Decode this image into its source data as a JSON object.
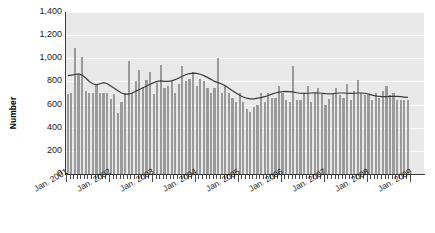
{
  "chart_data": {
    "type": "bar",
    "title": "",
    "subtitle": "",
    "xlabel": "",
    "ylabel": "Number",
    "ylim": [
      0,
      1400
    ],
    "ytick_labels": [
      "1,400",
      "1,200",
      "1,000",
      "800",
      "600",
      "400",
      "200",
      "0"
    ],
    "ytick_values": [
      1400,
      1200,
      1000,
      800,
      600,
      400,
      200,
      0
    ],
    "grid": true,
    "legend": "none",
    "x_tick_interval": "monthly",
    "x_major_tick_interval": "yearly",
    "xtick_labels": [
      "Jan. 2001",
      "Jan. 2002",
      "Jan. 2003",
      "Jan. 2004",
      "Jan. 2005",
      "Jan. 2006",
      "Jan. 2007",
      "Jan. 2008",
      "Jan. 2009"
    ],
    "colors": {
      "bar": "#9a9a9a",
      "trend_line": "#3a3a3a",
      "plot_background": "#e9e9e9",
      "gridline": "#fbfbfb",
      "axis": "#3a3a3a",
      "text": "#1a1a1a"
    },
    "series": [
      {
        "name": "Number",
        "type": "bar",
        "values": [
          690,
          700,
          1090,
          860,
          1010,
          720,
          700,
          700,
          780,
          700,
          700,
          700,
          650,
          690,
          530,
          620,
          700,
          980,
          700,
          800,
          900,
          750,
          810,
          880,
          690,
          790,
          940,
          740,
          760,
          800,
          700,
          780,
          930,
          800,
          820,
          880,
          760,
          820,
          800,
          740,
          700,
          740,
          1000,
          700,
          760,
          700,
          660,
          620,
          700,
          620,
          560,
          540,
          580,
          600,
          700,
          620,
          700,
          660,
          660,
          760,
          700,
          640,
          620,
          930,
          640,
          640,
          700,
          760,
          620,
          700,
          740,
          700,
          600,
          650,
          700,
          740,
          680,
          660,
          780,
          640,
          720,
          810,
          700,
          680,
          680,
          640,
          700,
          660,
          720,
          760,
          680,
          700,
          640,
          640,
          640,
          640
        ]
      },
      {
        "name": "Trend",
        "type": "line",
        "values": [
          850,
          855,
          860,
          865,
          855,
          830,
          800,
          780,
          770,
          780,
          790,
          780,
          760,
          740,
          720,
          700,
          690,
          690,
          700,
          715,
          730,
          745,
          760,
          775,
          790,
          800,
          805,
          800,
          800,
          805,
          815,
          830,
          845,
          860,
          868,
          872,
          870,
          862,
          850,
          835,
          818,
          800,
          790,
          778,
          762,
          742,
          720,
          700,
          680,
          665,
          655,
          650,
          650,
          655,
          660,
          668,
          678,
          690,
          700,
          708,
          712,
          714,
          712,
          708,
          702,
          698,
          696,
          698,
          700,
          702,
          700,
          698,
          694,
          692,
          694,
          698,
          700,
          700,
          698,
          696,
          698,
          700,
          700,
          698,
          690,
          682,
          675,
          670,
          668,
          668,
          670,
          672,
          670,
          668,
          665,
          662
        ]
      }
    ]
  }
}
